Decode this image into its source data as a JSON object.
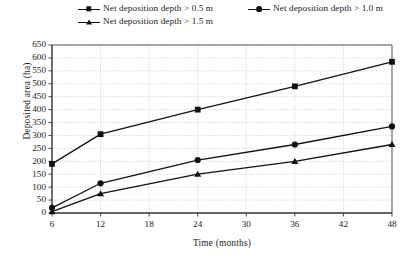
{
  "chart_data": {
    "type": "line",
    "title": "",
    "xlabel": "Time (months)",
    "ylabel": "Deposited area (ha)",
    "x": [
      6,
      12,
      24,
      36,
      48
    ],
    "categories": [
      "6",
      "12",
      "24",
      "36",
      "48"
    ],
    "xlim": [
      6,
      48
    ],
    "ylim": [
      0,
      650
    ],
    "xticks": [
      "6",
      "12",
      "18",
      "24",
      "30",
      "36",
      "42",
      "48"
    ],
    "xtick_values": [
      6,
      12,
      18,
      24,
      30,
      36,
      42,
      48
    ],
    "yticks": [
      "0",
      "50",
      "100",
      "150",
      "200",
      "250",
      "300",
      "350",
      "400",
      "450",
      "500",
      "550",
      "600",
      "650"
    ],
    "ytick_values": [
      0,
      50,
      100,
      150,
      200,
      250,
      300,
      350,
      400,
      450,
      500,
      550,
      600,
      650
    ],
    "grid": true,
    "legend_position": "top",
    "series": [
      {
        "name": "Net deposition depth > 0.5 m",
        "marker": "square",
        "color": "#111111",
        "values": [
          190,
          305,
          400,
          490,
          585
        ]
      },
      {
        "name": "Net deposition depth > 1.0 m",
        "marker": "circle",
        "color": "#111111",
        "values": [
          20,
          115,
          205,
          265,
          335
        ]
      },
      {
        "name": "Net deposition depth > 1.5 m",
        "marker": "triangle",
        "color": "#111111",
        "values": [
          5,
          75,
          150,
          200,
          265
        ]
      }
    ]
  },
  "legend": {
    "entries": [
      {
        "label": "Net deposition depth > 0.5 m",
        "marker": "square"
      },
      {
        "label": "Net deposition depth > 1.0 m",
        "marker": "circle"
      },
      {
        "label": "Net deposition depth > 1.5 m",
        "marker": "triangle"
      }
    ]
  },
  "axes": {
    "y_title": "Deposited area (ha)",
    "x_title": "Time (months)"
  }
}
